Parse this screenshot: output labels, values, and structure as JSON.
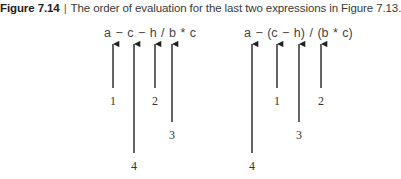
{
  "caption": {
    "figure_number": "Figure 7.14",
    "separator": "|",
    "text": "The order of evaluation for the last two expressions in Figure 7.13."
  },
  "diagrams": [
    {
      "expression": "a − c − h / b * c",
      "arrows": [
        {
          "x": 113,
          "label": "1",
          "end_y": 88,
          "label_y": 94
        },
        {
          "x": 134,
          "label": "4",
          "end_y": 153,
          "label_y": 159
        },
        {
          "x": 155,
          "label": "2",
          "end_y": 88,
          "label_y": 94
        },
        {
          "x": 172,
          "label": "3",
          "end_y": 122,
          "label_y": 128
        }
      ]
    },
    {
      "expression": "a − (c − h) / (b * c)",
      "arrows": [
        {
          "x": 252,
          "label": "4",
          "end_y": 153,
          "label_y": 159
        },
        {
          "x": 277,
          "label": "1",
          "end_y": 88,
          "label_y": 94
        },
        {
          "x": 299,
          "label": "3",
          "end_y": 122,
          "label_y": 128
        },
        {
          "x": 321,
          "label": "2",
          "end_y": 88,
          "label_y": 94
        }
      ]
    }
  ],
  "colors": {
    "arrow": "#222222",
    "text": "#444444"
  }
}
